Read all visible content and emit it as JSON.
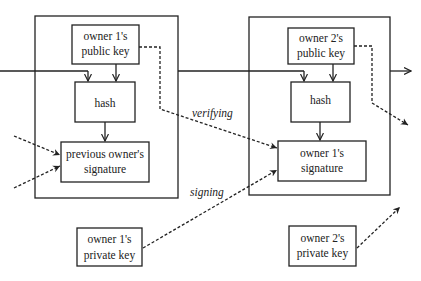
{
  "diagram": {
    "type": "bitcoin-transaction-chain",
    "colors": {
      "stroke": "#222222",
      "background": "#ffffff"
    },
    "transactions": [
      {
        "id": "tx-left",
        "public_key": [
          "owner 1's",
          "public key"
        ],
        "hash": "hash",
        "signature": [
          "previous owner's",
          "signature"
        ]
      },
      {
        "id": "tx-right",
        "public_key": [
          "owner 2's",
          "public key"
        ],
        "hash": "hash",
        "signature": [
          "owner 1's",
          "signature"
        ]
      }
    ],
    "private_keys": [
      {
        "id": "pk1",
        "label": [
          "owner 1's",
          "private key"
        ]
      },
      {
        "id": "pk2",
        "label": [
          "owner 2's",
          "private key"
        ]
      }
    ],
    "edge_labels": {
      "verifying": "verifying",
      "signing": "signing"
    }
  }
}
